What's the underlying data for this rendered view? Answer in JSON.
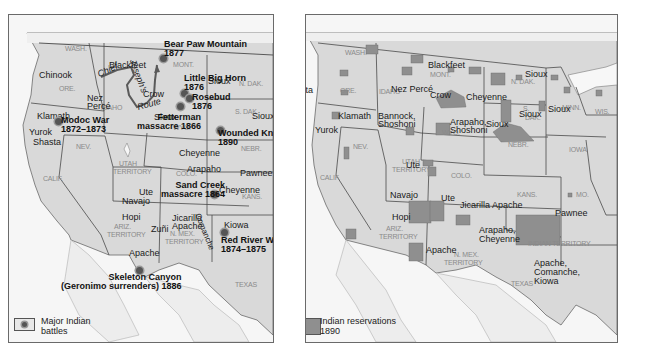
{
  "left_map": {
    "title": "Major Indian battles",
    "legend": {
      "icon": "battle-dot-icon",
      "label_line1": "Major Indian",
      "label_line2": "battles"
    },
    "states": [
      {
        "label": "WASH.",
        "x": 56,
        "y": 30
      },
      {
        "label": "ORE.",
        "x": 50,
        "y": 70
      },
      {
        "label": "IDAHO",
        "x": 92,
        "y": 89
      },
      {
        "label": "MONT.",
        "x": 164,
        "y": 46
      },
      {
        "label": "N. DAK.",
        "x": 230,
        "y": 65
      },
      {
        "label": "S. DAK.",
        "x": 226,
        "y": 93
      },
      {
        "label": "WYO.",
        "x": 164,
        "y": 109
      },
      {
        "label": "NEV.",
        "x": 67,
        "y": 128
      },
      {
        "label": "NEBR.",
        "x": 232,
        "y": 130
      },
      {
        "label": "UTAH",
        "x": 110,
        "y": 145
      },
      {
        "label": "TERRITORY",
        "x": 104,
        "y": 153
      },
      {
        "label": "CALIF.",
        "x": 34,
        "y": 160
      },
      {
        "label": "COLO.",
        "x": 167,
        "y": 155
      },
      {
        "label": "KANS.",
        "x": 233,
        "y": 178
      },
      {
        "label": "ARIZ.",
        "x": 105,
        "y": 208
      },
      {
        "label": "TERRITORY",
        "x": 98,
        "y": 216
      },
      {
        "label": "N. MEX.",
        "x": 161,
        "y": 215
      },
      {
        "label": "TERRITORY",
        "x": 156,
        "y": 223
      },
      {
        "label": "TEXAS",
        "x": 226,
        "y": 266
      }
    ],
    "tribes": [
      {
        "label": "Chinook",
        "x": 30,
        "y": 55
      },
      {
        "label": "Blackfeet",
        "x": 100,
        "y": 45
      },
      {
        "label": "Crow",
        "x": 134,
        "y": 74
      },
      {
        "label": "Sioux",
        "x": 199,
        "y": 61
      },
      {
        "label": "Nez",
        "x": 78,
        "y": 78
      },
      {
        "label": "Percé",
        "x": 78,
        "y": 86
      },
      {
        "label": "Klamath",
        "x": 28,
        "y": 96
      },
      {
        "label": "Sioux",
        "x": 145,
        "y": 97
      },
      {
        "label": "Sioux",
        "x": 243,
        "y": 96
      },
      {
        "label": "Yurok",
        "x": 20,
        "y": 112
      },
      {
        "label": "Shasta",
        "x": 24,
        "y": 122
      },
      {
        "label": "Cheyenne",
        "x": 170,
        "y": 133
      },
      {
        "label": "Arapaho",
        "x": 178,
        "y": 149
      },
      {
        "label": "Pawnee",
        "x": 231,
        "y": 153
      },
      {
        "label": "Cheyenne",
        "x": 210,
        "y": 170
      },
      {
        "label": "Ute",
        "x": 130,
        "y": 172
      },
      {
        "label": "Navajo",
        "x": 113,
        "y": 181
      },
      {
        "label": "Jicarilla",
        "x": 163,
        "y": 198
      },
      {
        "label": "Apache",
        "x": 163,
        "y": 206
      },
      {
        "label": "Hopi",
        "x": 113,
        "y": 197
      },
      {
        "label": "Kiowa",
        "x": 215,
        "y": 205
      },
      {
        "label": "Zuñi",
        "x": 142,
        "y": 209
      },
      {
        "label": "Apache",
        "x": 120,
        "y": 233
      }
    ],
    "battles": [
      {
        "name": "Bear Paw Mountain",
        "year": "1877",
        "dot_x": 151,
        "dot_y": 40,
        "x": 155,
        "y": 25,
        "align": "left"
      },
      {
        "name": "Little Big Horn",
        "year": "1876",
        "dot_x": 172,
        "dot_y": 75,
        "x": 175,
        "y": 59,
        "align": "left"
      },
      {
        "name": "Rosebud",
        "year": "1876",
        "dot_x": 177,
        "dot_y": 80,
        "x": 183,
        "y": 78,
        "align": "left"
      },
      {
        "name": "Fetterman",
        "year": "massacre 1866",
        "dot_x": 168,
        "dot_y": 88,
        "x": 128,
        "y": 98,
        "align": "right"
      },
      {
        "name": "Modoc War",
        "year": "1872–1873",
        "dot_x": 46,
        "dot_y": 103,
        "x": 52,
        "y": 101,
        "align": "left"
      },
      {
        "name": "Wounded Knee",
        "year": "1890",
        "dot_x": 208,
        "dot_y": 112,
        "x": 209,
        "y": 114,
        "align": "left"
      },
      {
        "name": "Sand Creek",
        "year": "massacre 1864",
        "dot_x": 202,
        "dot_y": 176,
        "x": 152,
        "y": 166,
        "align": "right"
      },
      {
        "name": "Red River War",
        "year": "1874–1875",
        "dot_x": 212,
        "dot_y": 214,
        "x": 212,
        "y": 221,
        "align": "left"
      },
      {
        "name": "Skeleton Canyon",
        "year": "(Geronimo surrenders) 1886",
        "dot_x": 127,
        "dot_y": 252,
        "x": 52,
        "y": 258,
        "align": "right"
      }
    ],
    "route_label": {
      "line1": "Chief",
      "line2": "Joseph's",
      "line3": "Route"
    },
    "comanche_label": "Comanche"
  },
  "right_map": {
    "title": "Indian reservations 1890",
    "legend": {
      "icon": "reservation-swatch-icon",
      "label_line1": "Indian reservations",
      "label_line2": "1890"
    },
    "states": [
      {
        "label": "WASH.",
        "x": 39,
        "y": 34
      },
      {
        "label": "ORE.",
        "x": 34,
        "y": 72
      },
      {
        "label": "IDAHO",
        "x": 73,
        "y": 73
      },
      {
        "label": "MONT.",
        "x": 124,
        "y": 56
      },
      {
        "label": "N. DAK.",
        "x": 205,
        "y": 63
      },
      {
        "label": "S.",
        "x": 217,
        "y": 90
      },
      {
        "label": "DAK.",
        "x": 219,
        "y": 99
      },
      {
        "label": "MINN.",
        "x": 256,
        "y": 89
      },
      {
        "label": "WIS.",
        "x": 289,
        "y": 93
      },
      {
        "label": "WYO.",
        "x": 136,
        "y": 114
      },
      {
        "label": "NEV.",
        "x": 47,
        "y": 128
      },
      {
        "label": "NEBR.",
        "x": 202,
        "y": 126
      },
      {
        "label": "IOWA",
        "x": 263,
        "y": 131
      },
      {
        "label": "UTAH",
        "x": 96,
        "y": 143
      },
      {
        "label": "TERRITORY",
        "x": 86,
        "y": 151
      },
      {
        "label": "CALIF.",
        "x": 14,
        "y": 159
      },
      {
        "label": "COLO.",
        "x": 145,
        "y": 157
      },
      {
        "label": "KANS.",
        "x": 211,
        "y": 176
      },
      {
        "label": "MO.",
        "x": 270,
        "y": 176
      },
      {
        "label": "ARIZ.",
        "x": 80,
        "y": 210
      },
      {
        "label": "TERRITORY",
        "x": 73,
        "y": 218
      },
      {
        "label": "INDIAN TERRITORY",
        "x": 222,
        "y": 225
      },
      {
        "label": "N. MEX.",
        "x": 148,
        "y": 236
      },
      {
        "label": "TERRITORY",
        "x": 138,
        "y": 244
      },
      {
        "label": "TEXAS",
        "x": 205,
        "y": 265
      }
    ],
    "tribes": [
      {
        "label": "Shasta",
        "x": -21,
        "y": 70
      },
      {
        "label": "Blackfeet",
        "x": 122,
        "y": 45
      },
      {
        "label": "Sioux",
        "x": 219,
        "y": 54
      },
      {
        "label": "Nez Percé",
        "x": 85,
        "y": 69
      },
      {
        "label": "Crow",
        "x": 124,
        "y": 75
      },
      {
        "label": "Cheyenne",
        "x": 160,
        "y": 77
      },
      {
        "label": "Klamath",
        "x": 32,
        "y": 96
      },
      {
        "label": "Bannock,",
        "x": 72,
        "y": 96
      },
      {
        "label": "Shoshoni",
        "x": 72,
        "y": 104
      },
      {
        "label": "Sioux",
        "x": 213,
        "y": 94
      },
      {
        "label": "Sioux",
        "x": 242,
        "y": 89
      },
      {
        "label": "Yurok",
        "x": 9,
        "y": 110
      },
      {
        "label": "Arapaho,",
        "x": 144,
        "y": 102
      },
      {
        "label": "Shoshoni",
        "x": 144,
        "y": 110
      },
      {
        "label": "Sioux",
        "x": 180,
        "y": 104
      },
      {
        "label": "Ute",
        "x": 100,
        "y": 145
      },
      {
        "label": "Navajo",
        "x": 84,
        "y": 175
      },
      {
        "label": "Ute",
        "x": 135,
        "y": 178
      },
      {
        "label": "Jicarilla Apache",
        "x": 154,
        "y": 185
      },
      {
        "label": "Pawnee",
        "x": 249,
        "y": 193
      },
      {
        "label": "Hopi",
        "x": 86,
        "y": 197
      },
      {
        "label": "Arapaho,",
        "x": 173,
        "y": 210
      },
      {
        "label": "Cheyenne",
        "x": 173,
        "y": 219
      },
      {
        "label": "Apache",
        "x": 120,
        "y": 230
      },
      {
        "label": "Apache,",
        "x": 228,
        "y": 243
      },
      {
        "label": "Comanche,",
        "x": 228,
        "y": 252
      },
      {
        "label": "Kiowa",
        "x": 228,
        "y": 261
      }
    ]
  },
  "colors": {
    "land": "#d8d8d8",
    "land_light": "#e6e6e6",
    "water": "#f7f7f7",
    "border": "#4a4a4a",
    "reservation": "#8f8f8f",
    "battle_dot": "#555555",
    "route": "#5a5a5a"
  }
}
